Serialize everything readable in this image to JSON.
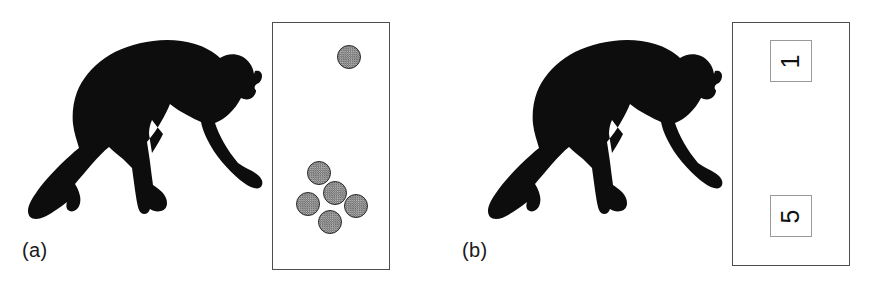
{
  "figure": {
    "background_color": "#ffffff",
    "width": 879,
    "height": 293
  },
  "panels": [
    {
      "id": "a",
      "label": "(a)",
      "subject_icon": "chimpanzee-silhouette",
      "tray": {
        "border_color": "#4e4e4e",
        "fill_color": "#ffffff",
        "condition": "dot-arrays",
        "groups": [
          {
            "name": "top-array",
            "count": 1
          },
          {
            "name": "bottom-array",
            "count": 5
          }
        ],
        "dots": [
          {
            "name": "dot-top-1",
            "x": 64,
            "y": 22,
            "group": "top-array"
          },
          {
            "name": "dot-cluster-1",
            "x": 34,
            "y": 138,
            "group": "bottom-array"
          },
          {
            "name": "dot-cluster-2",
            "x": 50,
            "y": 158,
            "group": "bottom-array"
          },
          {
            "name": "dot-cluster-3",
            "x": 23,
            "y": 169,
            "group": "bottom-array"
          },
          {
            "name": "dot-cluster-4",
            "x": 71,
            "y": 171,
            "group": "bottom-array"
          },
          {
            "name": "dot-cluster-5",
            "x": 45,
            "y": 187,
            "group": "bottom-array"
          }
        ],
        "dot_style": {
          "fill_color": "#8d8d8d",
          "outline_color": "#2b2b2b",
          "texture": "stippled-halftone",
          "diameter_px": 24
        }
      }
    },
    {
      "id": "b",
      "label": "(b)",
      "subject_icon": "chimpanzee-silhouette",
      "tray": {
        "border_color": "#4e4e4e",
        "fill_color": "#ffffff",
        "condition": "arabic-numerals",
        "cards": [
          {
            "name": "numeral-card-top",
            "value": "1",
            "rotation_deg": -90
          },
          {
            "name": "numeral-card-bottom",
            "value": "5",
            "rotation_deg": -90
          }
        ],
        "card_style": {
          "border_color": "#9a9a9a",
          "fill_color": "#ffffff",
          "size_px": 42
        }
      }
    }
  ],
  "silhouette": {
    "name": "chimpanzee-silhouette",
    "fill_color": "#0d0d0d",
    "description": "knuckle-walking chimpanzee facing right"
  }
}
